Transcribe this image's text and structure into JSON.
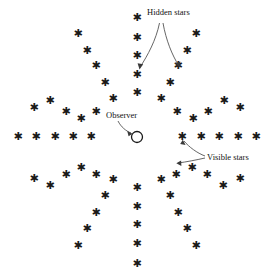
{
  "figure": {
    "type": "radial-star-diagram",
    "width": 270,
    "height": 277,
    "background_color": "#ffffff",
    "ink_color": "#1a1a1a"
  },
  "labels": {
    "hidden_stars": "Hidden stars",
    "observer": "Observer",
    "visible_stars": "Visible stars"
  },
  "observer": {
    "shape": "circle-outline",
    "cx": 137,
    "cy": 137,
    "r": 5.5
  },
  "star_glyph": "✱",
  "diagram_data": {
    "type": "scatter",
    "description": "Twelve radial rays of stars emanating from a central observer; each ray holds five star glyphs at increasing radius.",
    "center": [
      137,
      137
    ],
    "rays": 12,
    "stars_per_ray": 5,
    "ray_angles_deg": [
      0,
      30,
      60,
      90,
      120,
      150,
      180,
      210,
      240,
      270,
      300,
      330
    ],
    "radii": [
      31,
      54,
      76,
      98,
      120
    ],
    "stars": [
      {
        "ray": 0,
        "index": 0,
        "x": 18,
        "y": 136
      },
      {
        "ray": 0,
        "index": 1,
        "x": 36,
        "y": 136
      },
      {
        "ray": 0,
        "index": 2,
        "x": 55,
        "y": 136
      },
      {
        "ray": 0,
        "index": 3,
        "x": 73,
        "y": 136
      },
      {
        "ray": 0,
        "index": 4,
        "x": 91,
        "y": 136
      },
      {
        "ray": 1,
        "index": 0,
        "x": 34,
        "y": 107
      },
      {
        "ray": 1,
        "index": 1,
        "x": 50,
        "y": 100
      },
      {
        "ray": 1,
        "index": 2,
        "x": 66,
        "y": 111
      },
      {
        "ray": 1,
        "index": 3,
        "x": 81,
        "y": 118
      },
      {
        "ray": 1,
        "index": 4,
        "x": 96,
        "y": 111
      },
      {
        "ray": 2,
        "index": 0,
        "x": 78,
        "y": 33
      },
      {
        "ray": 2,
        "index": 1,
        "x": 87,
        "y": 50
      },
      {
        "ray": 2,
        "index": 2,
        "x": 96,
        "y": 65
      },
      {
        "ray": 2,
        "index": 3,
        "x": 105,
        "y": 82
      },
      {
        "ray": 2,
        "index": 4,
        "x": 113,
        "y": 98
      },
      {
        "ray": 3,
        "index": 0,
        "x": 137,
        "y": 17
      },
      {
        "ray": 3,
        "index": 1,
        "x": 137,
        "y": 37
      },
      {
        "ray": 3,
        "index": 2,
        "x": 137,
        "y": 55
      },
      {
        "ray": 3,
        "index": 3,
        "x": 137,
        "y": 74
      },
      {
        "ray": 3,
        "index": 4,
        "x": 137,
        "y": 92
      },
      {
        "ray": 4,
        "index": 0,
        "x": 196,
        "y": 33
      },
      {
        "ray": 4,
        "index": 1,
        "x": 187,
        "y": 50
      },
      {
        "ray": 4,
        "index": 2,
        "x": 178,
        "y": 65
      },
      {
        "ray": 4,
        "index": 3,
        "x": 170,
        "y": 82
      },
      {
        "ray": 4,
        "index": 4,
        "x": 161,
        "y": 98
      },
      {
        "ray": 5,
        "index": 0,
        "x": 240,
        "y": 107
      },
      {
        "ray": 5,
        "index": 1,
        "x": 224,
        "y": 100
      },
      {
        "ray": 5,
        "index": 2,
        "x": 208,
        "y": 111
      },
      {
        "ray": 5,
        "index": 3,
        "x": 193,
        "y": 118
      },
      {
        "ray": 5,
        "index": 4,
        "x": 177,
        "y": 111
      },
      {
        "ray": 6,
        "index": 0,
        "x": 256,
        "y": 136
      },
      {
        "ray": 6,
        "index": 1,
        "x": 238,
        "y": 136
      },
      {
        "ray": 6,
        "index": 2,
        "x": 219,
        "y": 136
      },
      {
        "ray": 6,
        "index": 3,
        "x": 201,
        "y": 136
      },
      {
        "ray": 6,
        "index": 4,
        "x": 182,
        "y": 136
      },
      {
        "ray": 7,
        "index": 0,
        "x": 240,
        "y": 178
      },
      {
        "ray": 7,
        "index": 1,
        "x": 223,
        "y": 185
      },
      {
        "ray": 7,
        "index": 2,
        "x": 207,
        "y": 174
      },
      {
        "ray": 7,
        "index": 3,
        "x": 192,
        "y": 167
      },
      {
        "ray": 7,
        "index": 4,
        "x": 176,
        "y": 174
      },
      {
        "ray": 8,
        "index": 0,
        "x": 196,
        "y": 245
      },
      {
        "ray": 8,
        "index": 1,
        "x": 187,
        "y": 228
      },
      {
        "ray": 8,
        "index": 2,
        "x": 178,
        "y": 212
      },
      {
        "ray": 8,
        "index": 3,
        "x": 170,
        "y": 195
      },
      {
        "ray": 8,
        "index": 4,
        "x": 161,
        "y": 179
      },
      {
        "ray": 9,
        "index": 0,
        "x": 137,
        "y": 263
      },
      {
        "ray": 9,
        "index": 1,
        "x": 137,
        "y": 243
      },
      {
        "ray": 9,
        "index": 2,
        "x": 137,
        "y": 224
      },
      {
        "ray": 9,
        "index": 3,
        "x": 137,
        "y": 206
      },
      {
        "ray": 9,
        "index": 4,
        "x": 137,
        "y": 187
      },
      {
        "ray": 10,
        "index": 0,
        "x": 78,
        "y": 245
      },
      {
        "ray": 10,
        "index": 1,
        "x": 87,
        "y": 228
      },
      {
        "ray": 10,
        "index": 2,
        "x": 96,
        "y": 212
      },
      {
        "ray": 10,
        "index": 3,
        "x": 105,
        "y": 195
      },
      {
        "ray": 10,
        "index": 4,
        "x": 113,
        "y": 179
      },
      {
        "ray": 11,
        "index": 0,
        "x": 34,
        "y": 178
      },
      {
        "ray": 11,
        "index": 1,
        "x": 50,
        "y": 185
      },
      {
        "ray": 11,
        "index": 2,
        "x": 66,
        "y": 174
      },
      {
        "ray": 11,
        "index": 3,
        "x": 81,
        "y": 167
      },
      {
        "ray": 11,
        "index": 4,
        "x": 96,
        "y": 174
      }
    ]
  }
}
